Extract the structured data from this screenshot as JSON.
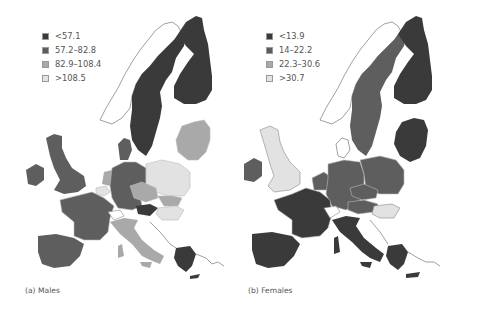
{
  "figure": {
    "panels": [
      {
        "id": "a",
        "caption": "(a) Males",
        "legend": [
          {
            "label": "<57.1",
            "color": "#3a3a3a"
          },
          {
            "label": "57.2–82.8",
            "color": "#5e5e5e"
          },
          {
            "label": "82.9–108.4",
            "color": "#a9a9a9"
          },
          {
            "label": ">108.5",
            "color": "#e2e2e2"
          }
        ],
        "regions": {
          "scandinavia_sweden": "<57.1",
          "finland": "<57.1",
          "denmark": "57.2–82.8",
          "uk": "57.2–82.8",
          "ireland": "57.2–82.8",
          "france": "57.2–82.8",
          "spain": "57.2–82.8",
          "germany": "57.2–82.8",
          "austria": "<57.1",
          "netherlands": "82.9–108.4",
          "belgium": ">108.5",
          "czech": "82.9–108.4",
          "slovakia": "82.9–108.4",
          "hungary": ">108.5",
          "poland": ">108.5",
          "baltics": "82.9–108.4",
          "italy": "82.9–108.4",
          "greece": "<57.1",
          "switzerland": "none"
        }
      },
      {
        "id": "b",
        "caption": "(b) Females",
        "legend": [
          {
            "label": "<13.9",
            "color": "#3a3a3a"
          },
          {
            "label": "14–22.2",
            "color": "#5e5e5e"
          },
          {
            "label": "22.3–30.6",
            "color": "#a9a9a9"
          },
          {
            "label": ">30.7",
            "color": "#e2e2e2"
          }
        ],
        "regions": {
          "sweden": "14–22.2",
          "finland": "<13.9",
          "baltics": "<13.9",
          "uk": ">30.7",
          "ireland": "14–22.2",
          "france": "<13.9",
          "spain": "<13.9",
          "italy": "<13.9",
          "germany": "14–22.2",
          "poland": "14–22.2",
          "czech": "14–22.2",
          "slovakia": "<13.9",
          "hungary": ">30.7",
          "austria": "14–22.2",
          "greece": "<13.9"
        }
      }
    ]
  }
}
